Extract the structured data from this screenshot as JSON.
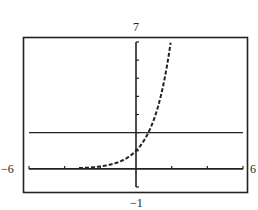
{
  "chart_data": {
    "type": "line",
    "title": "",
    "xlabel": "",
    "ylabel": "",
    "xlim": [
      -6,
      6
    ],
    "ylim": [
      -1,
      7
    ],
    "x_tick_spacing": 2,
    "y_tick_spacing": 1,
    "grid": false,
    "legend": null,
    "window_labels": {
      "xmin": "−6",
      "xmax": "6",
      "ymin": "−1",
      "ymax": "7"
    },
    "series": [
      {
        "name": "y = e^x",
        "style": "dotted",
        "function": "exp",
        "x": [
          -2.5,
          -2,
          -1.5,
          -1,
          -0.5,
          0,
          0.5,
          0.693,
          1,
          1.5,
          1.95
        ],
        "values": [
          0.08,
          0.14,
          0.22,
          0.37,
          0.61,
          1,
          1.65,
          2,
          2.72,
          4.48,
          7
        ]
      },
      {
        "name": "y = 2",
        "style": "solid",
        "function": "const",
        "x": [
          -6,
          6
        ],
        "values": [
          2,
          2
        ]
      }
    ]
  },
  "labels": {
    "top": "7",
    "bottom": "−1",
    "left": "−6",
    "right": "6"
  },
  "colors": {
    "ink": "#222222",
    "background": "#ffffff"
  }
}
